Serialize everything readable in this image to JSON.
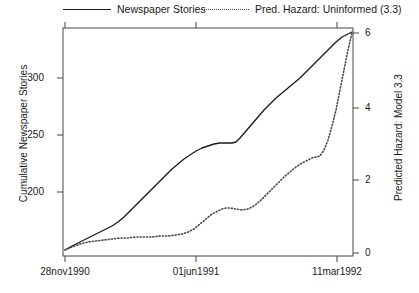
{
  "chart_data": {
    "type": "line",
    "title": "",
    "xlabel": "",
    "ylabel": "Cumulative Newspaper Stories",
    "y2label": "Predicted Hazard: Model 3.3",
    "grid": false,
    "legend_position": "top",
    "x_tick_labels": [
      "28nov1990",
      "01jun1991",
      "11mar1992"
    ],
    "x_tick_pixels": [
      65,
      196,
      337
    ],
    "xlim_pixels": [
      63,
      353
    ],
    "ylim_left": [
      145,
      340
    ],
    "y_left_ticks": [
      200,
      250,
      300
    ],
    "y_left_tick_pixels": [
      192,
      135,
      78
    ],
    "ylim_right": [
      -0.1,
      6.2
    ],
    "y_right_ticks": [
      0,
      2,
      4,
      6
    ],
    "y_right_tick_pixels": [
      253,
      180,
      108,
      33
    ],
    "series": [
      {
        "name": "Newspaper Stories",
        "style": "solid",
        "color": "#1a1a1a",
        "axis": "left",
        "points_px": [
          [
            65,
            250
          ],
          [
            72,
            246
          ],
          [
            80,
            242
          ],
          [
            88,
            238
          ],
          [
            96,
            234
          ],
          [
            104,
            230
          ],
          [
            112,
            226
          ],
          [
            118,
            222
          ],
          [
            124,
            217
          ],
          [
            130,
            211
          ],
          [
            136,
            205
          ],
          [
            142,
            199
          ],
          [
            148,
            193
          ],
          [
            154,
            187
          ],
          [
            160,
            181
          ],
          [
            166,
            175
          ],
          [
            172,
            169
          ],
          [
            178,
            164
          ],
          [
            184,
            159
          ],
          [
            190,
            155
          ],
          [
            196,
            151
          ],
          [
            202,
            148
          ],
          [
            208,
            146
          ],
          [
            214,
            144
          ],
          [
            220,
            143
          ],
          [
            226,
            143
          ],
          [
            232,
            143
          ],
          [
            236,
            142
          ],
          [
            240,
            138
          ],
          [
            246,
            131
          ],
          [
            252,
            124
          ],
          [
            258,
            117
          ],
          [
            264,
            110
          ],
          [
            270,
            104
          ],
          [
            276,
            98
          ],
          [
            282,
            93
          ],
          [
            288,
            88
          ],
          [
            294,
            83
          ],
          [
            300,
            78
          ],
          [
            306,
            72
          ],
          [
            312,
            66
          ],
          [
            318,
            60
          ],
          [
            324,
            54
          ],
          [
            330,
            48
          ],
          [
            336,
            42
          ],
          [
            342,
            37
          ],
          [
            348,
            34
          ],
          [
            352,
            32
          ]
        ],
        "values_at_ticks": [
          {
            "x_label": "28nov1990",
            "y": 148
          },
          {
            "x_label": "01jun1991",
            "y": 234
          },
          {
            "x_label": "11mar1992",
            "y": 332
          }
        ]
      },
      {
        "name": "Pred. Hazard: Uninformed (3.3)",
        "style": "dotted",
        "color": "#4a4a4a",
        "axis": "right",
        "points_px": [
          [
            65,
            250
          ],
          [
            72,
            247
          ],
          [
            80,
            244
          ],
          [
            88,
            242
          ],
          [
            96,
            241
          ],
          [
            104,
            240
          ],
          [
            112,
            239
          ],
          [
            120,
            238
          ],
          [
            128,
            238
          ],
          [
            136,
            237
          ],
          [
            144,
            237
          ],
          [
            152,
            237
          ],
          [
            160,
            236
          ],
          [
            168,
            236
          ],
          [
            176,
            235
          ],
          [
            182,
            234
          ],
          [
            188,
            232
          ],
          [
            194,
            229
          ],
          [
            200,
            224
          ],
          [
            206,
            219
          ],
          [
            212,
            214
          ],
          [
            218,
            211
          ],
          [
            222,
            209
          ],
          [
            226,
            208
          ],
          [
            230,
            208
          ],
          [
            236,
            209
          ],
          [
            242,
            210
          ],
          [
            248,
            209
          ],
          [
            254,
            206
          ],
          [
            260,
            201
          ],
          [
            266,
            195
          ],
          [
            272,
            189
          ],
          [
            278,
            183
          ],
          [
            284,
            177
          ],
          [
            290,
            172
          ],
          [
            296,
            167
          ],
          [
            302,
            163
          ],
          [
            308,
            160
          ],
          [
            312,
            158
          ],
          [
            316,
            157
          ],
          [
            320,
            156
          ],
          [
            324,
            150
          ],
          [
            328,
            140
          ],
          [
            332,
            126
          ],
          [
            336,
            110
          ],
          [
            340,
            90
          ],
          [
            344,
            70
          ],
          [
            348,
            50
          ],
          [
            352,
            33
          ]
        ],
        "values_at_ticks": [
          {
            "x_label": "28nov1990",
            "y": 0.08
          },
          {
            "x_label": "01jun1991",
            "y": 0.78
          },
          {
            "x_label": "11mar1992",
            "y": 2.6
          }
        ]
      }
    ],
    "legend": [
      {
        "label": "Newspaper Stories",
        "style": "solid"
      },
      {
        "label": "Pred. Hazard: Uninformed (3.3)",
        "style": "dotted"
      }
    ]
  },
  "legend": {
    "items": [
      {
        "label": "Newspaper Stories"
      },
      {
        "label": "Pred. Hazard: Uninformed (3.3)"
      }
    ]
  },
  "axes": {
    "left_title": "Cumulative Newspaper Stories",
    "right_title": "Predicted Hazard: Model 3.3",
    "left_ticks": [
      "300",
      "250",
      "200"
    ],
    "right_ticks": [
      "6",
      "4",
      "2",
      "0"
    ],
    "bottom_ticks": [
      "28nov1990",
      "01jun1991",
      "11mar1992"
    ]
  }
}
